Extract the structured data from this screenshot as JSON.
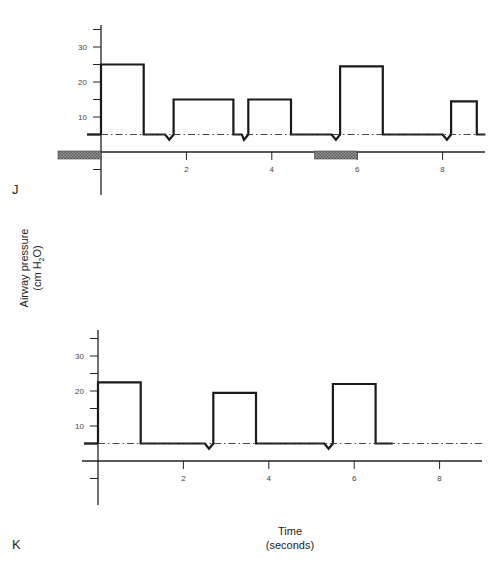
{
  "chart_data": [
    {
      "type": "line",
      "panel_label": "J",
      "title": "",
      "xlabel": "Time (seconds)",
      "ylabel": "Airway pressure (cm H2O)",
      "xlim": [
        0,
        9
      ],
      "ylim": [
        -10,
        37
      ],
      "x_ticks": [
        2,
        4,
        6,
        8
      ],
      "y_ticks_labeled": [
        10,
        20,
        30
      ],
      "y_tick_interval": 5,
      "grid": false,
      "baseline_peep": 5,
      "series": [
        {
          "name": "airway pressure",
          "style": "solid-thick",
          "points": [
            [
              0,
              5
            ],
            [
              0,
              25
            ],
            [
              1.0,
              25
            ],
            [
              1.0,
              5
            ],
            [
              1.5,
              5
            ],
            [
              1.6,
              3.5
            ],
            [
              1.7,
              5
            ],
            [
              1.7,
              15
            ],
            [
              3.1,
              15
            ],
            [
              3.1,
              5
            ],
            [
              3.3,
              5
            ],
            [
              3.35,
              3.5
            ],
            [
              3.45,
              5
            ],
            [
              3.45,
              15
            ],
            [
              4.45,
              15
            ],
            [
              4.45,
              5
            ],
            [
              5.4,
              5
            ],
            [
              5.5,
              3.5
            ],
            [
              5.6,
              5
            ],
            [
              5.6,
              24.5
            ],
            [
              6.6,
              24.5
            ],
            [
              6.6,
              5
            ],
            [
              8.0,
              5
            ],
            [
              8.1,
              3.5
            ],
            [
              8.2,
              5
            ],
            [
              8.2,
              14.5
            ],
            [
              8.8,
              14.5
            ],
            [
              8.8,
              5
            ],
            [
              9.0,
              5
            ]
          ]
        },
        {
          "name": "PEEP baseline",
          "style": "dash-dot",
          "points": [
            [
              0,
              5
            ],
            [
              9,
              5
            ]
          ]
        }
      ],
      "annotations": [
        {
          "type": "hatched-bar",
          "x_start": -1.0,
          "x_end": 0,
          "y": -1.5
        },
        {
          "type": "hatched-bar",
          "x_start": 5.0,
          "x_end": 6.0,
          "y": -1.5
        }
      ]
    },
    {
      "type": "line",
      "panel_label": "K",
      "title": "",
      "xlabel": "Time (seconds)",
      "ylabel": "Airway pressure (cm H2O)",
      "xlim": [
        0,
        9
      ],
      "ylim": [
        -10,
        37
      ],
      "x_ticks": [
        2,
        4,
        6,
        8
      ],
      "y_ticks_labeled": [
        10,
        20,
        30
      ],
      "y_tick_interval": 5,
      "grid": false,
      "baseline_peep": 5,
      "series": [
        {
          "name": "airway pressure",
          "style": "solid-thick",
          "points": [
            [
              0,
              5
            ],
            [
              0,
              22.5
            ],
            [
              1.0,
              22.5
            ],
            [
              1.0,
              5
            ],
            [
              2.5,
              5
            ],
            [
              2.6,
              3.5
            ],
            [
              2.7,
              5
            ],
            [
              2.7,
              19.5
            ],
            [
              3.7,
              19.5
            ],
            [
              3.7,
              5
            ],
            [
              5.3,
              5
            ],
            [
              5.4,
              3.5
            ],
            [
              5.5,
              5
            ],
            [
              5.5,
              22
            ],
            [
              6.5,
              22
            ],
            [
              6.5,
              5
            ],
            [
              6.9,
              5
            ]
          ]
        },
        {
          "name": "PEEP baseline",
          "style": "dash-dot",
          "points": [
            [
              0,
              5
            ],
            [
              9,
              5
            ]
          ]
        }
      ]
    }
  ],
  "labels": {
    "panel_j": "J",
    "panel_k": "K",
    "y_axis_line1": "Airway pressure",
    "y_axis_line2_prefix": "(cm H",
    "y_axis_line2_sub": "2",
    "y_axis_line2_suffix": "O)",
    "x_axis_line1": "Time",
    "x_axis_line2": "(seconds)"
  },
  "tick_labels": {
    "x": [
      "2",
      "4",
      "6",
      "8"
    ],
    "y": [
      "10",
      "20",
      "30"
    ]
  }
}
